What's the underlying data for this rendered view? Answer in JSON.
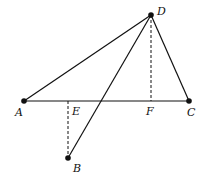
{
  "diagram": {
    "type": "geometry",
    "points": {
      "A": {
        "label": "A",
        "x": 24,
        "y": 101,
        "label_x": 15,
        "label_y": 116,
        "dot": true
      },
      "B": {
        "label": "B",
        "x": 68,
        "y": 158,
        "label_x": 73,
        "label_y": 172,
        "dot": true
      },
      "C": {
        "label": "C",
        "x": 189,
        "y": 101,
        "label_x": 187,
        "label_y": 116,
        "dot": true
      },
      "D": {
        "label": "D",
        "x": 151,
        "y": 15,
        "label_x": 157,
        "label_y": 15,
        "dot": true
      },
      "E": {
        "label": "E",
        "x": 68,
        "y": 101,
        "label_x": 72,
        "label_y": 115,
        "dot": false
      },
      "F": {
        "label": "F",
        "x": 151,
        "y": 101,
        "label_x": 146,
        "label_y": 115,
        "dot": false
      }
    },
    "segments": [
      {
        "from": "A",
        "to": "C",
        "style": "solid"
      },
      {
        "from": "A",
        "to": "D",
        "style": "solid"
      },
      {
        "from": "D",
        "to": "C",
        "style": "solid"
      },
      {
        "from": "D",
        "to": "B",
        "style": "solid"
      },
      {
        "from": "D",
        "to": "F",
        "style": "dashed"
      },
      {
        "from": "E",
        "to": "B",
        "style": "dashed"
      }
    ]
  }
}
